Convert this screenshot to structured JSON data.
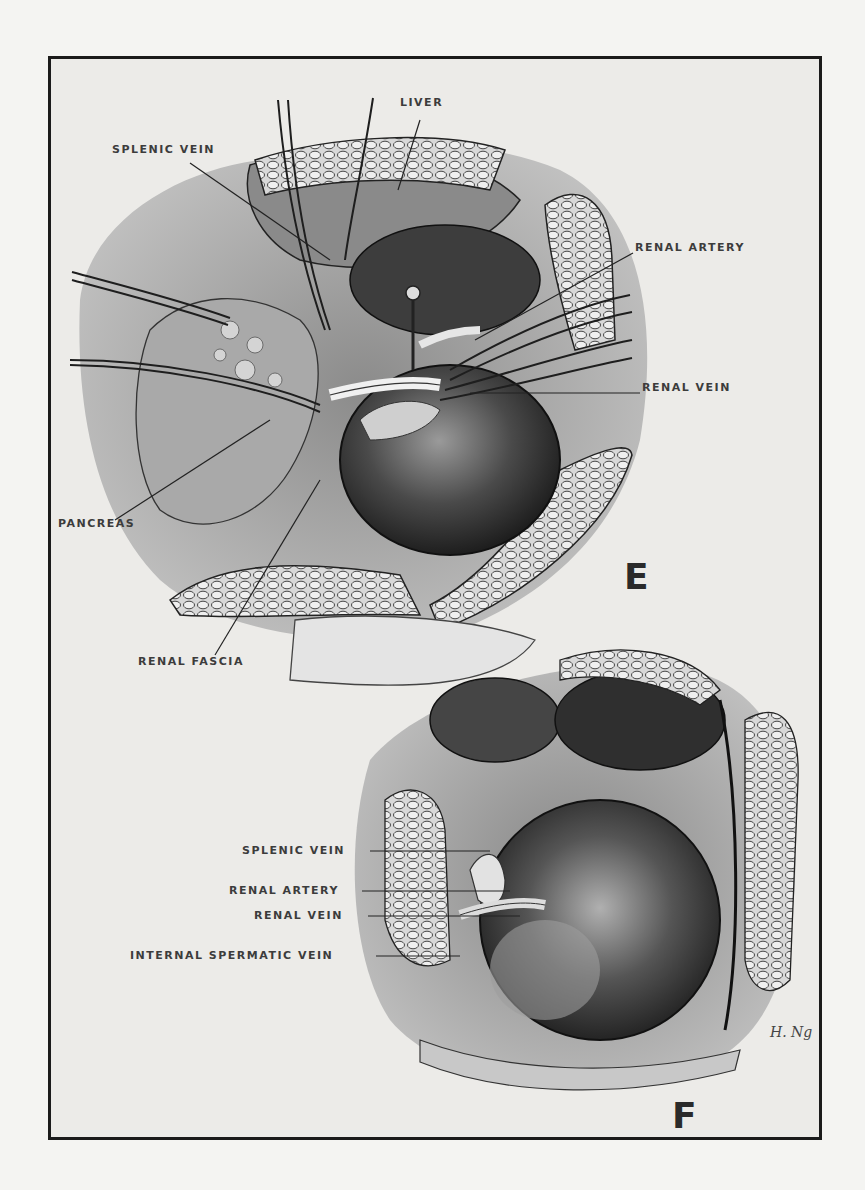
{
  "figure": {
    "panels": [
      {
        "id": "E",
        "letter": "E",
        "labels": [
          {
            "text": "LIVER",
            "x": 400,
            "y": 103
          },
          {
            "text": "SPLENIC VEIN",
            "x": 112,
            "y": 150
          },
          {
            "text": "RENAL ARTERY",
            "x": 635,
            "y": 248
          },
          {
            "text": "RENAL VEIN",
            "x": 642,
            "y": 388
          },
          {
            "text": "PANCREAS",
            "x": 58,
            "y": 524
          },
          {
            "text": "RENAL FASCIA",
            "x": 138,
            "y": 662
          }
        ]
      },
      {
        "id": "F",
        "letter": "F",
        "labels": [
          {
            "text": "SPLENIC VEIN",
            "x": 242,
            "y": 846
          },
          {
            "text": "RENAL ARTERY",
            "x": 229,
            "y": 886
          },
          {
            "text": "RENAL VEIN",
            "x": 254,
            "y": 911
          },
          {
            "text": "INTERNAL SPERMATIC VEIN",
            "x": 130,
            "y": 950
          }
        ]
      }
    ],
    "signature": "H. Ng",
    "colors": {
      "page": "#f4f4f2",
      "panel_bg": "#ecebe8",
      "ink": "#1b1b1b",
      "label": "#3c3c3c",
      "organ_dark": "#2e2e2e",
      "organ_mid": "#6a6a6a",
      "organ_light": "#b8b8b8"
    }
  }
}
